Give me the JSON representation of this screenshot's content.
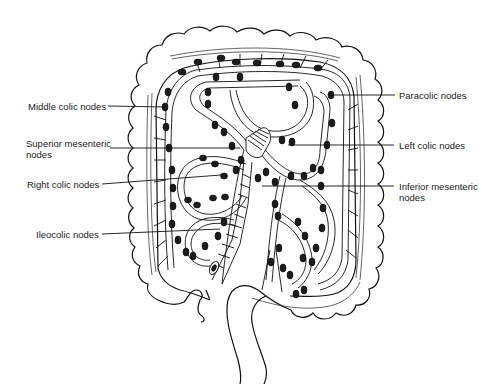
{
  "figure": {
    "colors": {
      "ink": "#111111",
      "background": "#ffffff",
      "node_fill": "#1c1c1c"
    }
  },
  "labels": {
    "left": [
      {
        "id": "middle-colic",
        "text": "Middle colic nodes"
      },
      {
        "id": "superior-mesenteric",
        "text": "Superior mesenteric nodes"
      },
      {
        "id": "right-colic",
        "text": "Right colic nodes"
      },
      {
        "id": "ileocolic",
        "text": "Ileocolic nodes"
      }
    ],
    "right": [
      {
        "id": "paracolic",
        "text": "Paracolic nodes"
      },
      {
        "id": "left-colic",
        "text": "Left colic nodes"
      },
      {
        "id": "inferior-mesenteric",
        "text": "Inferior mesenteric nodes"
      }
    ]
  }
}
